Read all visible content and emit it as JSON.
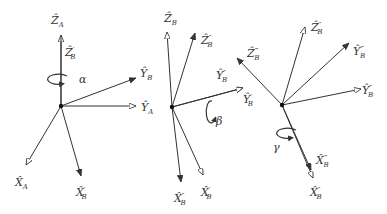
{
  "diagram": {
    "title": "",
    "panels": [
      {
        "id": "rotation-alpha",
        "angle_label": "α",
        "origin": [
          61,
          106
        ],
        "axes": [
          {
            "label": "Ẑ",
            "sub": "A",
            "prime": "",
            "tip": [
              61,
              35
            ],
            "label_pos": [
              51,
              24
            ],
            "head": "open"
          },
          {
            "label": "Ẑ",
            "sub": "B",
            "prime": "′",
            "tip": [
              61,
              35
            ],
            "label_pos": [
              65,
              56
            ],
            "head": "none"
          },
          {
            "label": "Ŷ",
            "sub": "B",
            "prime": "",
            "tip": [
              136,
              78
            ],
            "label_pos": [
              140,
              77
            ],
            "head": "filled"
          },
          {
            "label": "Ŷ",
            "sub": "A",
            "prime": "",
            "tip": [
              136,
              106
            ],
            "label_pos": [
              141,
              111
            ],
            "head": "open"
          },
          {
            "label": "X̂",
            "sub": "A",
            "prime": "",
            "tip": [
              26,
              165
            ],
            "label_pos": [
              15,
              186
            ],
            "head": "open"
          },
          {
            "label": "X̂",
            "sub": "B",
            "prime": "′",
            "tip": [
              81,
              176
            ],
            "label_pos": [
              76,
              196
            ],
            "head": "filled"
          }
        ],
        "rotation": {
          "center": [
            61,
            79
          ],
          "label_pos": [
            79,
            83
          ]
        }
      },
      {
        "id": "rotation-beta",
        "angle_label": "β",
        "origin": [
          172,
          107
        ],
        "axes": [
          {
            "label": "Ẑ",
            "sub": "B",
            "prime": "",
            "tip": [
              167,
              32
            ],
            "label_pos": [
              164,
              22
            ],
            "head": "open"
          },
          {
            "label": "Ẑ",
            "sub": "B",
            "prime": "″",
            "tip": [
              195,
              33
            ],
            "label_pos": [
              201,
              44
            ],
            "head": "filled"
          },
          {
            "label": "Ŷ",
            "sub": "B",
            "prime": "″",
            "tip": [
              243,
              88
            ],
            "label_pos": [
              216,
              79
            ],
            "head": "filled"
          },
          {
            "label": "Ŷ",
            "sub": "B",
            "prime": "′",
            "tip": [
              243,
              88
            ],
            "label_pos": [
              243,
              103
            ],
            "head": "open"
          },
          {
            "label": "X̂",
            "sub": "B",
            "prime": "″",
            "tip": [
              181,
              182
            ],
            "label_pos": [
              174,
              202
            ],
            "head": "filled"
          },
          {
            "label": "X̂",
            "sub": "B",
            "prime": "′",
            "tip": [
              203,
              175
            ],
            "label_pos": [
              201,
              196
            ],
            "head": "open"
          }
        ],
        "rotation": {
          "center": [
            210,
            112
          ],
          "label_pos": [
            216,
            125
          ]
        }
      },
      {
        "id": "rotation-gamma",
        "angle_label": "γ",
        "origin": [
          282,
          105
        ],
        "axes": [
          {
            "label": "Ẑ",
            "sub": "B",
            "prime": "‴",
            "tip": [
              237,
              58
            ],
            "label_pos": [
              247,
              57
            ],
            "head": "filled"
          },
          {
            "label": "Ẑ",
            "sub": "B",
            "prime": "″",
            "tip": [
              305,
              27
            ],
            "label_pos": [
              311,
              31
            ],
            "head": "open"
          },
          {
            "label": "Ŷ",
            "sub": "B",
            "prime": "‴",
            "tip": [
              349,
              43
            ],
            "label_pos": [
              353,
              55
            ],
            "head": "filled"
          },
          {
            "label": "Ŷ",
            "sub": "B",
            "prime": "″",
            "tip": [
              361,
              89
            ],
            "label_pos": [
              362,
              94
            ],
            "head": "open"
          },
          {
            "label": "X̂",
            "sub": "B",
            "prime": "‴",
            "tip": [
              311,
              170
            ],
            "label_pos": [
              316,
              164
            ],
            "head": "filled"
          },
          {
            "label": "X̂",
            "sub": "B",
            "prime": "″",
            "tip": [
              313,
              178
            ],
            "label_pos": [
              310,
              196
            ],
            "head": "open"
          }
        ],
        "rotation": {
          "center": [
            290,
            133
          ],
          "label_pos": [
            273,
            151
          ]
        }
      }
    ]
  }
}
